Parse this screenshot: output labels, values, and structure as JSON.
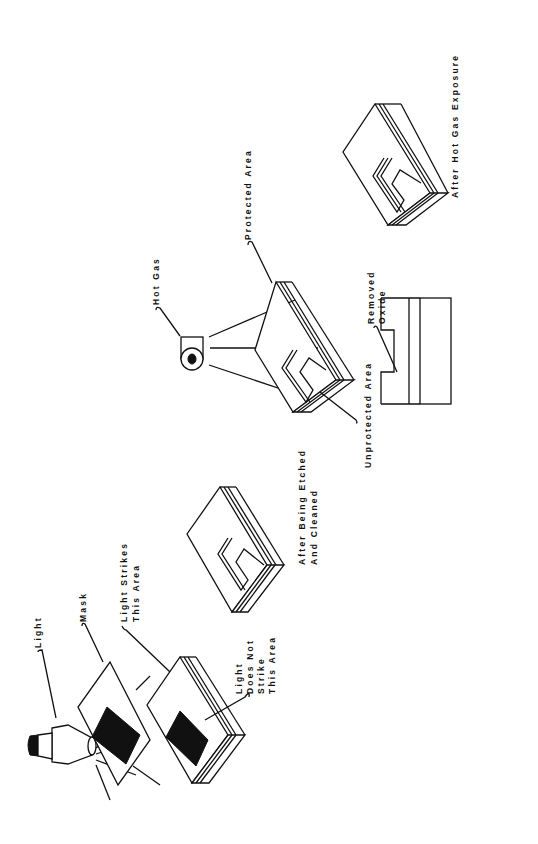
{
  "orientation": "rotated-90-ccw",
  "labels": {
    "light": "Light",
    "mask": "Mask",
    "light_strikes_1": "Light Strikes",
    "light_strikes_2": "This Area",
    "light_not_1": "Light",
    "light_not_2": "Does Not",
    "light_not_3": "Strike",
    "light_not_4": "This Area",
    "etched_1": "After Being Etched",
    "etched_2": "And Cleaned",
    "hot_gas": "Hot Gas",
    "protected_area": "Protected Area",
    "unprotected_area": "Unprotected Area",
    "removed_1": "Removed",
    "removed_2": "Oxide",
    "after_hot_gas": "After Hot Gas Exposure"
  },
  "steps": [
    {
      "id": "exposure",
      "caption": "Light through mask onto wafer"
    },
    {
      "id": "etched",
      "caption": "After Being Etched And Cleaned"
    },
    {
      "id": "hot-gas",
      "caption": "Hot gas applied to unprotected area"
    },
    {
      "id": "cross-section",
      "caption": "Removed Oxide"
    },
    {
      "id": "result",
      "caption": "After Hot Gas Exposure"
    }
  ]
}
